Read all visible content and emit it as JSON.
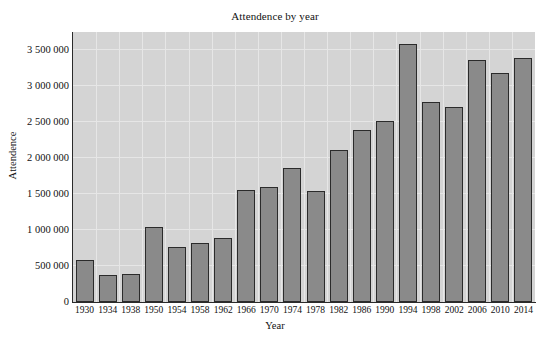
{
  "chart_data": {
    "type": "bar",
    "title": "Attendence by year",
    "xlabel": "Year",
    "ylabel": "Attendence",
    "categories": [
      "1930",
      "1934",
      "1938",
      "1950",
      "1954",
      "1958",
      "1962",
      "1966",
      "1970",
      "1974",
      "1978",
      "1982",
      "1986",
      "1990",
      "1994",
      "1998",
      "2002",
      "2006",
      "2010",
      "2014"
    ],
    "values": [
      590000,
      375000,
      385000,
      1040000,
      760000,
      820000,
      890000,
      1560000,
      1600000,
      1860000,
      1540000,
      2110000,
      2390000,
      2520000,
      3590000,
      2780000,
      2710000,
      3360000,
      3180000,
      3390000
    ],
    "ylim": [
      0,
      3750000
    ],
    "yticks": [
      0,
      500000,
      1000000,
      1500000,
      2000000,
      2500000,
      3000000,
      3500000
    ],
    "ytick_labels": [
      "0",
      "500 000",
      "1 000 000",
      "1 500 000",
      "2 000 000",
      "2 500 000",
      "3 000 000",
      "3 500 000"
    ],
    "grid": true,
    "legend": "none",
    "bar_color": "#8a8a8a",
    "bar_edge_color": "#2b2b2b",
    "plot_background": "#d4d4d4",
    "gridline_color": "#e6e6e6",
    "figure_background": "#ffffff"
  }
}
